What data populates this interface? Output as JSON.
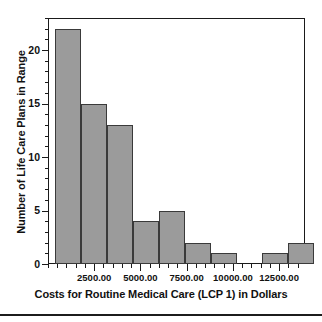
{
  "chart_data": {
    "type": "bar",
    "title": "",
    "subtitle": "",
    "xlabel": "Costs for Routine Medical Care (LCP 1) in Dollars",
    "ylabel": "Number of Life Care Plans in Range",
    "grid": false,
    "legend": null,
    "legend_position": "none",
    "xlim": [
      0,
      13900
    ],
    "ylim": [
      0,
      23
    ],
    "bin_width": 1400,
    "bin_start": 400,
    "xtick_labels": [
      "2500.00",
      "5000.00",
      "7500.00",
      "10000.00",
      "12500.00"
    ],
    "xtick_values": [
      2500,
      5000,
      7500,
      10000,
      12500
    ],
    "ytick_labels": [
      "0",
      "5",
      "10",
      "15",
      "20"
    ],
    "ytick_values": [
      0,
      5,
      10,
      15,
      20
    ],
    "categories": [
      "400-1800",
      "1800-3200",
      "3200-4600",
      "4600-6000",
      "6000-7400",
      "7400-8800",
      "8800-10200",
      "10200-11600",
      "11600-13000",
      "13000-14400"
    ],
    "values": [
      22,
      15,
      13,
      4,
      5,
      2,
      1,
      0,
      1,
      2
    ],
    "bar_fill_color": "#9b9b9b",
    "bar_edge_color": "#3a3a3a",
    "axis_color": "#1a1a1a",
    "background_color": "#ffffff"
  }
}
